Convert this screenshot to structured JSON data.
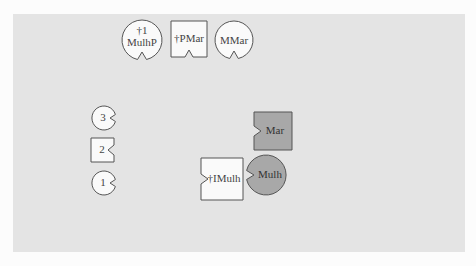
{
  "diagram": {
    "background_color": "#e4e4e4",
    "page_color": "#fcfcfc",
    "stroke_color": "#555555",
    "light_fill": "#fafafa",
    "dark_fill": "#a8a8a8",
    "nodes": [
      {
        "id": "n-1mulhp",
        "shape": "circle",
        "line1": "†1",
        "line2": "MulhP",
        "fill": "light",
        "notch": "bottom"
      },
      {
        "id": "n-pmar",
        "shape": "square",
        "label": "†PMar",
        "fill": "light",
        "notch": "bottom"
      },
      {
        "id": "n-mmar",
        "shape": "circle",
        "label": "MMar",
        "fill": "light",
        "notch": "bottom"
      },
      {
        "id": "n-3",
        "shape": "circle",
        "label": "3",
        "fill": "light",
        "notch": "right"
      },
      {
        "id": "n-2",
        "shape": "square",
        "label": "2",
        "fill": "light",
        "notch": "right"
      },
      {
        "id": "n-1",
        "shape": "circle",
        "label": "1",
        "fill": "light",
        "notch": "right"
      },
      {
        "id": "n-mar",
        "shape": "square",
        "label": "Mar",
        "fill": "dark",
        "notch": "left"
      },
      {
        "id": "n-imulh",
        "shape": "square",
        "label": "†IMulh",
        "fill": "light",
        "notch": "left"
      },
      {
        "id": "n-mulh",
        "shape": "circle",
        "label": "Mulh",
        "fill": "dark",
        "notch": "left"
      }
    ]
  }
}
